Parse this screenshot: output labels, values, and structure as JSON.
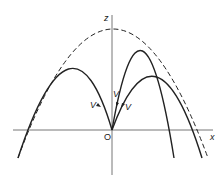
{
  "diagram": {
    "title": "",
    "axes": {
      "x_label": "x",
      "z_label": "z",
      "origin_label": "O"
    },
    "curves": [
      {
        "name": "envelope-parabola",
        "style": "dashed"
      },
      {
        "name": "left-trajectory",
        "style": "solid"
      },
      {
        "name": "steep-right-trajectory",
        "style": "solid"
      },
      {
        "name": "wide-right-trajectory",
        "style": "solid"
      }
    ],
    "velocity_labels": [
      "V",
      "V",
      "V"
    ],
    "colors": {
      "line": "#222222",
      "axis": "#555555",
      "background": "#ffffff"
    }
  }
}
